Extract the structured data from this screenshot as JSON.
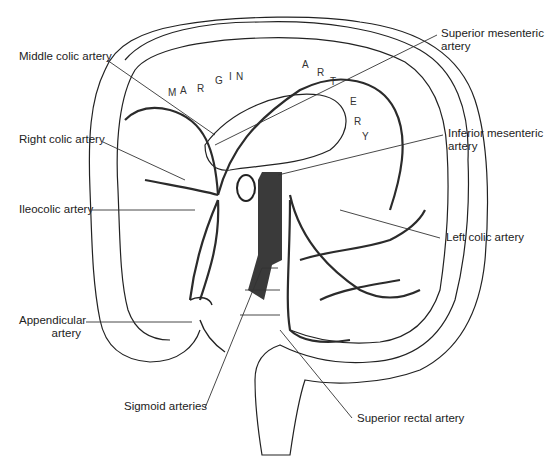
{
  "diagram": {
    "labels": {
      "middle_colic": "Middle colic artery",
      "right_colic": "Right colic artery",
      "ileocolic": "Ileocolic artery",
      "appendicular_1": "Appendicular",
      "appendicular_2": "artery",
      "sup_mes_1": "Superior mesenteric",
      "sup_mes_2": "artery",
      "inf_mes_1": "Inferior mesenteric",
      "inf_mes_2": "artery",
      "left_colic": "Left colic artery",
      "sigmoid": "Sigmoid arteries",
      "sup_rectal": "Superior rectal artery"
    },
    "marginal_letters": [
      "M",
      "A",
      "R",
      "G",
      "I",
      "N",
      "A",
      "L",
      "A",
      "R",
      "T",
      "E",
      "R",
      "Y"
    ],
    "colors": {
      "line": "#1a1a1a",
      "vessel": "#2b2b2b",
      "aorta": "#3a3a3a",
      "paper": "#ffffff"
    }
  }
}
